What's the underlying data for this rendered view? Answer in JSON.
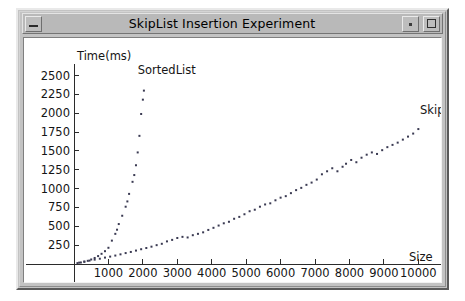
{
  "window": {
    "title": "SkipList Insertion Experiment",
    "buttons": {
      "minimize": "–",
      "restore": "·",
      "maximize": "□"
    }
  },
  "chart_data": {
    "type": "scatter",
    "title": "SkipList Insertion Experiment",
    "xlabel": "Size",
    "ylabel": "Time(ms)",
    "xlim": [
      0,
      10600
    ],
    "ylim": [
      0,
      2600
    ],
    "grid": false,
    "legend_position": "inline-annotation",
    "xticks": [
      1000,
      2000,
      3000,
      4000,
      5000,
      6000,
      7000,
      8000,
      9000,
      10000
    ],
    "yticks": [
      250,
      500,
      750,
      1000,
      1250,
      1500,
      1750,
      2000,
      2250,
      2500
    ],
    "annotations": [
      {
        "text": "SortedList",
        "x": 1850,
        "y": 2520
      },
      {
        "text": "Skip",
        "x": 10050,
        "y": 1990
      }
    ],
    "series": [
      {
        "name": "SortedList",
        "marker": "dot",
        "color": "#3a3a52",
        "points": [
          [
            100,
            12
          ],
          [
            200,
            20
          ],
          [
            300,
            30
          ],
          [
            400,
            42
          ],
          [
            500,
            60
          ],
          [
            600,
            80
          ],
          [
            700,
            105
          ],
          [
            800,
            135
          ],
          [
            900,
            170
          ],
          [
            1000,
            215
          ],
          [
            1100,
            310
          ],
          [
            1200,
            400
          ],
          [
            1250,
            455
          ],
          [
            1300,
            530
          ],
          [
            1400,
            640
          ],
          [
            1500,
            760
          ],
          [
            1550,
            830
          ],
          [
            1600,
            930
          ],
          [
            1700,
            1090
          ],
          [
            1750,
            1180
          ],
          [
            1800,
            1310
          ],
          [
            1850,
            1480
          ],
          [
            1900,
            1700
          ],
          [
            1950,
            1990
          ],
          [
            2000,
            2180
          ],
          [
            2030,
            2300
          ]
        ]
      },
      {
        "name": "Skip",
        "marker": "dot",
        "color": "#3a3a52",
        "points": [
          [
            150,
            18
          ],
          [
            300,
            32
          ],
          [
            450,
            45
          ],
          [
            600,
            58
          ],
          [
            750,
            70
          ],
          [
            900,
            85
          ],
          [
            1050,
            98
          ],
          [
            1200,
            112
          ],
          [
            1350,
            128
          ],
          [
            1500,
            145
          ],
          [
            1650,
            160
          ],
          [
            1800,
            178
          ],
          [
            1950,
            196
          ],
          [
            2100,
            212
          ],
          [
            2250,
            230
          ],
          [
            2400,
            250
          ],
          [
            2550,
            268
          ],
          [
            2700,
            300
          ],
          [
            2850,
            320
          ],
          [
            3000,
            345
          ],
          [
            3150,
            360
          ],
          [
            3300,
            352
          ],
          [
            3450,
            382
          ],
          [
            3600,
            400
          ],
          [
            3750,
            420
          ],
          [
            3900,
            452
          ],
          [
            4050,
            480
          ],
          [
            4200,
            510
          ],
          [
            4350,
            540
          ],
          [
            4500,
            560
          ],
          [
            4650,
            600
          ],
          [
            4800,
            625
          ],
          [
            4950,
            660
          ],
          [
            5100,
            700
          ],
          [
            5250,
            720
          ],
          [
            5400,
            760
          ],
          [
            5550,
            790
          ],
          [
            5700,
            805
          ],
          [
            5850,
            845
          ],
          [
            6000,
            880
          ],
          [
            6150,
            900
          ],
          [
            6300,
            940
          ],
          [
            6450,
            980
          ],
          [
            6600,
            1010
          ],
          [
            6750,
            1050
          ],
          [
            6900,
            1080
          ],
          [
            7050,
            1120
          ],
          [
            7200,
            1190
          ],
          [
            7350,
            1230
          ],
          [
            7500,
            1270
          ],
          [
            7650,
            1230
          ],
          [
            7800,
            1290
          ],
          [
            7900,
            1330
          ],
          [
            8050,
            1380
          ],
          [
            8200,
            1350
          ],
          [
            8350,
            1410
          ],
          [
            8500,
            1450
          ],
          [
            8650,
            1480
          ],
          [
            8800,
            1460
          ],
          [
            8950,
            1510
          ],
          [
            9100,
            1550
          ],
          [
            9250,
            1580
          ],
          [
            9400,
            1610
          ],
          [
            9550,
            1650
          ],
          [
            9700,
            1690
          ],
          [
            9850,
            1730
          ],
          [
            10000,
            1790
          ]
        ]
      }
    ]
  }
}
